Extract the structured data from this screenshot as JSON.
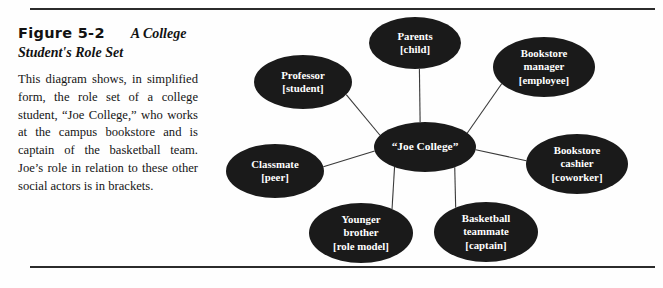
{
  "figure": {
    "number": "Figure 5-2",
    "title": "A College Student's Role Set",
    "caption": "This diagram shows, in simplified form, the role set of a college student, “Joe College,” who works at the campus bookstore and is captain of the basketball team. Joe’s role in relation to these other social actors is in brackets."
  },
  "colors": {
    "node_fill": "#1a1a1a",
    "node_text": "#ffffff",
    "rule": "#2b2b2b",
    "spoke": "#3a3a3a",
    "background": "#fefefe"
  },
  "chart_data": {
    "type": "diagram",
    "layout": "radial-hub-and-spoke",
    "title": "A College Student's Role Set",
    "center": {
      "id": "joe-college",
      "label": "“Joe College”",
      "cx": 225,
      "cy": 137,
      "rx": 51,
      "ry": 25
    },
    "nodes": [
      {
        "id": "parents",
        "label": "Parents\n[child]",
        "role": "child",
        "actor": "Parents",
        "cx": 215,
        "cy": 33,
        "rx": 46,
        "ry": 26
      },
      {
        "id": "bookstore-manager",
        "label": "Bookstore\nmanager\n[employee]",
        "role": "employee",
        "actor": "Bookstore manager",
        "cx": 344,
        "cy": 57,
        "rx": 51,
        "ry": 30
      },
      {
        "id": "bookstore-cashier",
        "label": "Bookstore\ncashier\n[coworker]",
        "role": "coworker",
        "actor": "Bookstore cashier",
        "cx": 377,
        "cy": 154,
        "rx": 51,
        "ry": 30
      },
      {
        "id": "basketball-teammate",
        "label": "Basketball\nteammate\n[captain]",
        "role": "captain",
        "actor": "Basketball teammate",
        "cx": 286,
        "cy": 222,
        "rx": 52,
        "ry": 30
      },
      {
        "id": "younger-brother",
        "label": "Younger\nbrother\n[role model]",
        "role": "role model",
        "actor": "Younger brother",
        "cx": 161,
        "cy": 223,
        "rx": 52,
        "ry": 30
      },
      {
        "id": "classmate",
        "label": "Classmate\n[peer]",
        "role": "peer",
        "actor": "Classmate",
        "cx": 75,
        "cy": 161,
        "rx": 49,
        "ry": 27
      },
      {
        "id": "professor",
        "label": "Professor\n[student]",
        "role": "student",
        "actor": "Professor",
        "cx": 103,
        "cy": 72,
        "rx": 49,
        "ry": 27
      }
    ],
    "edges": [
      {
        "from": "joe-college",
        "to": "parents"
      },
      {
        "from": "joe-college",
        "to": "bookstore-manager"
      },
      {
        "from": "joe-college",
        "to": "bookstore-cashier"
      },
      {
        "from": "joe-college",
        "to": "basketball-teammate"
      },
      {
        "from": "joe-college",
        "to": "younger-brother"
      },
      {
        "from": "joe-college",
        "to": "classmate"
      },
      {
        "from": "joe-college",
        "to": "professor"
      }
    ]
  }
}
